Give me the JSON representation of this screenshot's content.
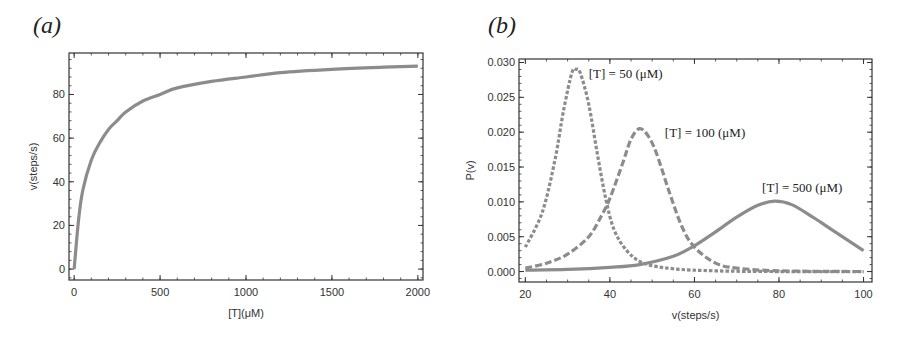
{
  "panels": {
    "a": {
      "label": "(a)"
    },
    "b": {
      "label": "(b)"
    }
  },
  "chart_data": [
    {
      "type": "line",
      "panel": "(a)",
      "title": "",
      "xlabel": "[T](μM)",
      "ylabel": "v(steps/s)",
      "xlim": [
        -30,
        2030
      ],
      "ylim": [
        -5,
        99
      ],
      "xticks": [
        "0",
        "500",
        "1000",
        "1500",
        "2000"
      ],
      "yticks": [
        "0",
        "20",
        "40",
        "60",
        "80"
      ],
      "grid": false,
      "series": [
        {
          "name": "v vs [T]",
          "style": "solid",
          "color": "#8c8c8c",
          "x": [
            0,
            25,
            50,
            100,
            150,
            200,
            250,
            300,
            400,
            500,
            600,
            800,
            1000,
            1200,
            1500,
            1800,
            2000
          ],
          "y": [
            0,
            22,
            36,
            50,
            58,
            64,
            68,
            72,
            77,
            80,
            83,
            86,
            88,
            90,
            91.5,
            92.5,
            93
          ]
        }
      ]
    },
    {
      "type": "line",
      "panel": "(b)",
      "title": "",
      "xlabel": "v(steps/s)",
      "ylabel": "P(v)",
      "xlim": [
        18.5,
        102
      ],
      "ylim": [
        -0.0015,
        0.0305
      ],
      "xticks": [
        "20",
        "40",
        "60",
        "80",
        "100"
      ],
      "yticks": [
        "0.000",
        "0.005",
        "0.010",
        "0.015",
        "0.020",
        "0.025",
        "0.030"
      ],
      "grid": false,
      "annotations": [
        {
          "text": "[T] = 50 (μM)",
          "x": 35,
          "y": 0.0278
        },
        {
          "text": "[T] = 100 (μM)",
          "x": 53,
          "y": 0.0193
        },
        {
          "text": "[T] = 500 (μM)",
          "x": 76,
          "y": 0.0114
        }
      ],
      "series": [
        {
          "name": "[T] = 50 (μM)",
          "style": "dotted",
          "color": "#8c8c8c",
          "x": [
            20,
            24,
            27,
            29,
            31,
            32,
            33,
            35,
            37,
            39,
            41,
            44,
            48,
            55,
            65,
            80,
            100
          ],
          "y": [
            0.0035,
            0.0085,
            0.016,
            0.023,
            0.0285,
            0.029,
            0.0285,
            0.024,
            0.017,
            0.0105,
            0.006,
            0.003,
            0.0012,
            0.0004,
            0.0001,
            0.0,
            0.0
          ]
        },
        {
          "name": "[T] = 100 (μM)",
          "style": "dashed",
          "color": "#8c8c8c",
          "x": [
            20,
            25,
            30,
            35,
            38,
            40,
            43,
            45,
            47,
            49,
            51,
            54,
            57,
            60,
            65,
            70,
            80,
            100
          ],
          "y": [
            0.0005,
            0.0012,
            0.0025,
            0.005,
            0.008,
            0.0105,
            0.0155,
            0.019,
            0.0205,
            0.0195,
            0.017,
            0.0115,
            0.0065,
            0.0035,
            0.0012,
            0.0005,
            0.0001,
            0.0
          ]
        },
        {
          "name": "[T] = 500 (μM)",
          "style": "solid",
          "color": "#8c8c8c",
          "x": [
            20,
            30,
            40,
            47,
            55,
            60,
            65,
            70,
            75,
            79,
            83,
            88,
            93,
            100
          ],
          "y": [
            0.0002,
            0.0003,
            0.0006,
            0.001,
            0.0022,
            0.0037,
            0.0057,
            0.0078,
            0.0095,
            0.0101,
            0.0096,
            0.0078,
            0.0058,
            0.003
          ]
        }
      ]
    }
  ]
}
